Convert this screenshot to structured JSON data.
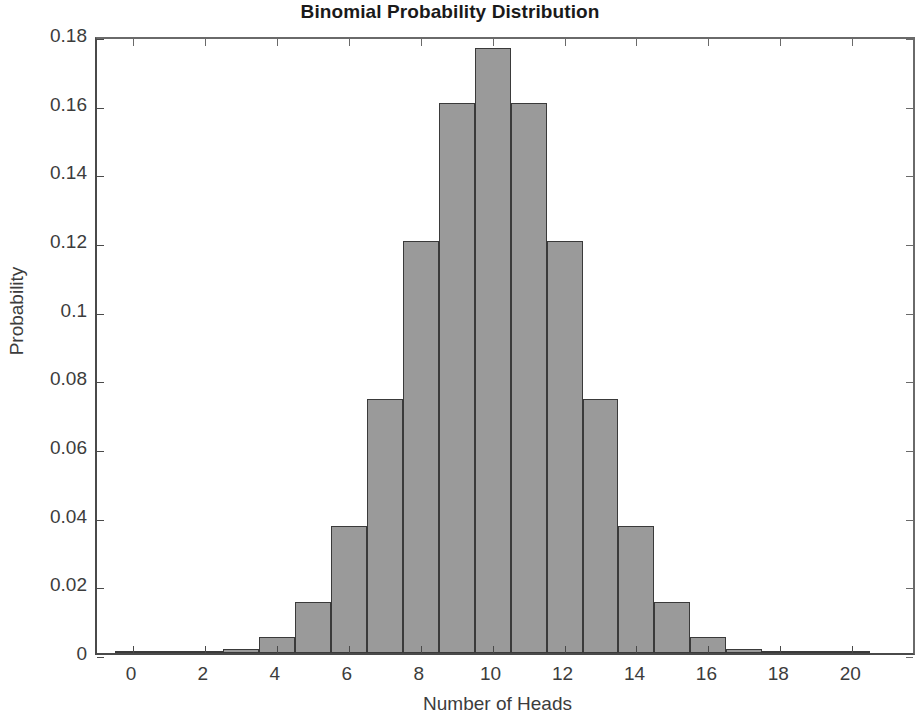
{
  "chart_data": {
    "type": "bar",
    "title": "Binomial Probability Distribution",
    "xlabel": "Number of Heads",
    "ylabel": "Probability",
    "categories": [
      0,
      1,
      2,
      3,
      4,
      5,
      6,
      7,
      8,
      9,
      10,
      11,
      12,
      13,
      14,
      15,
      16,
      17,
      18,
      19,
      20
    ],
    "values": [
      1e-06,
      1.91e-05,
      0.0001812,
      0.0010872,
      0.0046206,
      0.0147858,
      0.0369644,
      0.0739288,
      0.1201344,
      0.1601791,
      0.1761971,
      0.1601791,
      0.1201344,
      0.0739288,
      0.0369644,
      0.0147858,
      0.0046206,
      0.0010872,
      0.0001812,
      1.91e-05,
      1e-06
    ],
    "xlim": [
      -1,
      21.8
    ],
    "ylim": [
      0,
      0.18
    ],
    "xticks": [
      0,
      2,
      4,
      6,
      8,
      10,
      12,
      14,
      16,
      18,
      20
    ],
    "xtick_labels": [
      "0",
      "2",
      "4",
      "6",
      "8",
      "10",
      "12",
      "14",
      "16",
      "18",
      "20"
    ],
    "yticks": [
      0,
      0.02,
      0.04,
      0.06,
      0.08,
      0.1,
      0.12,
      0.14,
      0.16,
      0.18
    ],
    "ytick_labels": [
      "0",
      "0.02",
      "0.04",
      "0.06",
      "0.08",
      "0.1",
      "0.12",
      "0.14",
      "0.16",
      "0.18"
    ],
    "grid": false,
    "legend": null,
    "bar_fill_color": "#9a9a9a",
    "bar_edge_color": "#3a3a3a",
    "axis_color": "#4a4a4a",
    "text_color": "#3c3c3c"
  }
}
